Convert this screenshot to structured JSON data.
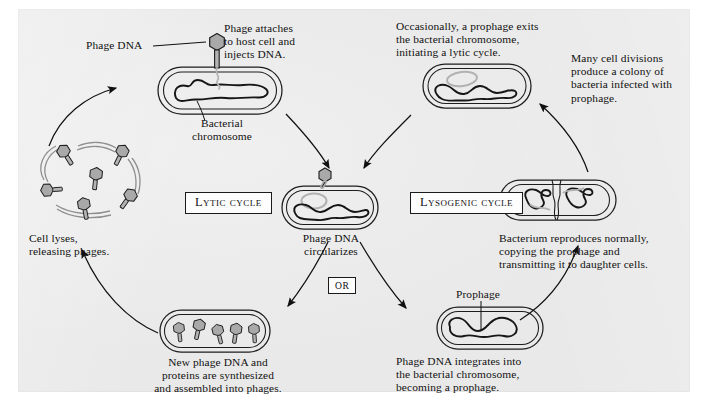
{
  "figure": {
    "background_color": "#e9e9e9",
    "ink_color": "#111111",
    "phage_fill": "#a8a8a8",
    "dna_loop_color": "#b6b6b6"
  },
  "cycle_labels": {
    "lytic": "Lytic cycle",
    "lysogenic": "Lysogenic cycle",
    "or": "OR"
  },
  "captions": {
    "phage_dna": "Phage DNA",
    "phage_attaches": "Phage attaches\nto host cell and\ninjects DNA.",
    "bacterial_chromosome": "Bacterial\nchromosome",
    "occasionally_prophage_exits": "Occasionally, a prophage exits\nthe bacterial chromosome,\ninitiating a lytic cycle.",
    "many_cell_divisions": "Many cell divisions\nproduce a colony of\nbacteria infected with\nprophage.",
    "cell_lyses": "Cell lyses,\nreleasing phages.",
    "phage_dna_circularizes": "Phage DNA\ncircularizes",
    "bacterium_reproduces": "Bacterium reproduces normally,\ncopying the prophage and\ntransmitting it to daughter cells.",
    "new_phage_dna": "New phage DNA and\nproteins are synthesized\nand assembled into phages.",
    "prophage": "Prophage",
    "phage_dna_integrates": "Phage DNA integrates into\nthe bacterial chromosome,\nbecoming a prophage."
  },
  "diagram_elements": {
    "cells": [
      {
        "name": "infected-host-cell-top",
        "note": "bacterium with phage attached injecting DNA"
      },
      {
        "name": "circularized-dna-cell",
        "note": "bacterium with circular phage DNA"
      },
      {
        "name": "prophage-exit-cell",
        "note": "bacterium with prophage exiting chromosome"
      },
      {
        "name": "dividing-bacterium-cell",
        "note": "bacterium reproducing with prophage copies"
      },
      {
        "name": "prophage-integrated-cell",
        "note": "bacterium with prophage integrated"
      },
      {
        "name": "assembled-phages-cell",
        "note": "bacterium filled with new phages"
      },
      {
        "name": "lysed-cell",
        "note": "burst cell releasing free phages"
      }
    ],
    "free_phage_count": 6,
    "assembled_phage_count": 5
  }
}
